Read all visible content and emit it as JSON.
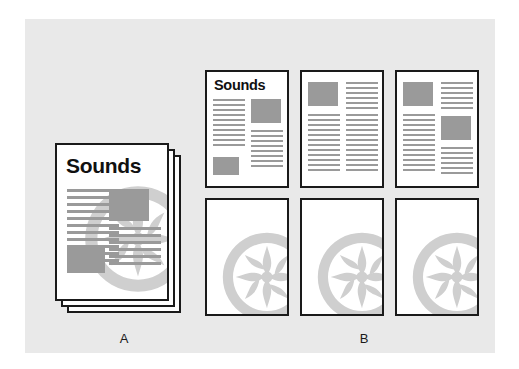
{
  "figure": {
    "background_color": "#ffffff",
    "panel_color": "#e9e9e9",
    "ink_color": "#1a1a1a",
    "content_gray": "#9a9a9a",
    "watermark_gray": "#cfcfcf"
  },
  "labels": {
    "a": "A",
    "b": "B"
  },
  "group_a": {
    "name": "Original document stack",
    "page_count": 3,
    "front_page": {
      "headline": "Sounds",
      "has_watermark": true
    }
  },
  "group_b": {
    "name": "Printed output pages",
    "rows": 2,
    "columns": 3,
    "pages": [
      {
        "position": "top-left",
        "headline": "Sounds",
        "has_watermark": false
      },
      {
        "position": "top-center",
        "headline": "",
        "has_watermark": false
      },
      {
        "position": "top-right",
        "headline": "",
        "has_watermark": false
      },
      {
        "position": "bottom-left",
        "headline": "",
        "has_watermark": true
      },
      {
        "position": "bottom-center",
        "headline": "",
        "has_watermark": true
      },
      {
        "position": "bottom-right",
        "headline": "",
        "has_watermark": true
      }
    ]
  }
}
